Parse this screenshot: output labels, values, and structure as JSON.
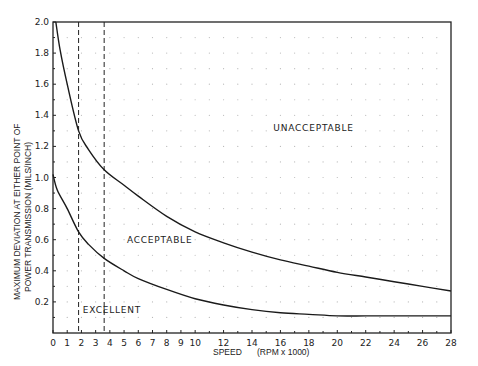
{
  "chart_data": {
    "type": "line",
    "title": "",
    "xlabel": "SPEED",
    "xlabel_units": "(RPM x 1000)",
    "ylabel_line1": "MAXIMUM DEVIATION AT EITHER POINT OF",
    "ylabel_line2": "POWER TRANSMISSION   (MILS/INCH)",
    "xlim": [
      0,
      28
    ],
    "ylim": [
      0,
      2.0
    ],
    "x_ticks": [
      "0",
      "1",
      "2",
      "3",
      "4",
      "5",
      "6",
      "7",
      "8",
      "9",
      "10",
      "12",
      "14",
      "16",
      "18",
      "20",
      "22",
      "24",
      "26",
      "28"
    ],
    "x_tick_values": [
      0,
      1,
      2,
      3,
      4,
      5,
      6,
      7,
      8,
      9,
      10,
      12,
      14,
      16,
      18,
      20,
      22,
      24,
      26,
      28
    ],
    "y_ticks": [
      "0.2",
      "0.4",
      "0.6",
      "0.8",
      "1.0",
      "1.2",
      "1.4",
      "1.6",
      "1.8",
      "2.0"
    ],
    "y_tick_values": [
      0.2,
      0.4,
      0.6,
      0.8,
      1.0,
      1.2,
      1.4,
      1.6,
      1.8,
      2.0
    ],
    "grid": "dotted",
    "series": [
      {
        "name": "Acceptable / Unacceptable boundary",
        "x": [
          0.2,
          0.5,
          1,
          1.8,
          2.5,
          3.6,
          5,
          6,
          8,
          10,
          12,
          14,
          16,
          18,
          20,
          22,
          24,
          26,
          28
        ],
        "values": [
          2.0,
          1.82,
          1.6,
          1.3,
          1.18,
          1.05,
          0.95,
          0.88,
          0.75,
          0.65,
          0.58,
          0.52,
          0.47,
          0.43,
          0.39,
          0.36,
          0.33,
          0.3,
          0.27
        ]
      },
      {
        "name": "Excellent / Acceptable boundary",
        "x": [
          0,
          0.3,
          1,
          1.8,
          2.5,
          3.6,
          5,
          6,
          8,
          10,
          12,
          14,
          16,
          18,
          20,
          22,
          24,
          26,
          28
        ],
        "values": [
          1.02,
          0.92,
          0.8,
          0.65,
          0.57,
          0.48,
          0.4,
          0.35,
          0.28,
          0.22,
          0.18,
          0.15,
          0.13,
          0.12,
          0.11,
          0.11,
          0.11,
          0.11,
          0.11
        ]
      }
    ],
    "vertical_dashed_lines": [
      1.8,
      3.6
    ],
    "annotations": [
      {
        "text": "UNACCEPTABLE",
        "x": 15.5,
        "y": 1.3
      },
      {
        "text": "ACCEPTABLE",
        "x": 5.2,
        "y": 0.58
      },
      {
        "text": "EXCELLENT",
        "x": 2.1,
        "y": 0.13
      }
    ]
  }
}
